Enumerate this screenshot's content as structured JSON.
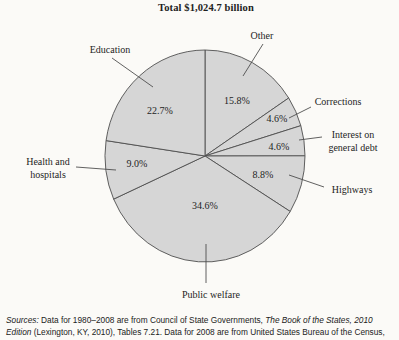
{
  "figure": {
    "title": "Total $1,024.7 billion",
    "source_lines": [
      [
        {
          "text": "Sources:",
          "italic": true
        },
        {
          "text": " Data for 1980–2008 are from Council of State Governments, ",
          "italic": false
        },
        {
          "text": "The Book of the States, 2010",
          "italic": true
        }
      ],
      [
        {
          "text": "Edition",
          "italic": true
        },
        {
          "text": " (Lexington, KY, 2010), Tables 7.21. Data for 2008 are from United States Bureau of the Census,",
          "italic": false
        }
      ]
    ]
  },
  "chart_data": {
    "type": "pie",
    "title": "Total $1,024.7 billion",
    "direction": "clockwise",
    "start_angle_deg": 0,
    "legend": "none",
    "categories": [
      "Other",
      "Corrections",
      "Interest on general debt",
      "Highways",
      "Public welfare",
      "Health and hospitals",
      "Education"
    ],
    "values": [
      15.8,
      4.6,
      4.6,
      8.8,
      34.6,
      9.0,
      22.7
    ],
    "geometry": {
      "cx": 205,
      "cy": 156,
      "rx": 100,
      "ry": 106
    },
    "slices": [
      {
        "label": "Other",
        "value": 15.8,
        "pct_text": "15.8%",
        "pct_pos": [
          237,
          100
        ],
        "name_lines": [
          "Other"
        ],
        "name_pos": [
          262,
          35
        ],
        "leader": [
          263,
          44,
          243,
          76
        ]
      },
      {
        "label": "Corrections",
        "value": 4.6,
        "pct_text": "4.6%",
        "pct_pos": [
          277,
          118
        ],
        "name_lines": [
          "Corrections"
        ],
        "name_pos": [
          338,
          101
        ],
        "leader": [
          311,
          107,
          289,
          118
        ]
      },
      {
        "label": "Interest on general debt",
        "value": 4.6,
        "pct_text": "4.6%",
        "pct_pos": [
          279,
          146
        ],
        "name_lines": [
          "Interest on",
          "general debt"
        ],
        "name_pos": [
          353,
          141
        ],
        "leader": [
          322,
          137,
          299,
          140
        ]
      },
      {
        "label": "Highways",
        "value": 8.8,
        "pct_text": "8.8%",
        "pct_pos": [
          263,
          174
        ],
        "name_lines": [
          "Highways"
        ],
        "name_pos": [
          352,
          189
        ],
        "leader": [
          324,
          187,
          289,
          175
        ]
      },
      {
        "label": "Public welfare",
        "value": 34.6,
        "pct_text": "34.6%",
        "pct_pos": [
          205,
          205
        ],
        "name_lines": [
          "Public welfare"
        ],
        "name_pos": [
          211,
          294
        ],
        "leader": [
          206,
          244,
          206,
          283
        ]
      },
      {
        "label": "Health and hospitals",
        "value": 9.0,
        "pct_text": "9.0%",
        "pct_pos": [
          137,
          163
        ],
        "name_lines": [
          "Health and",
          "hospitals"
        ],
        "name_pos": [
          48,
          168
        ],
        "leader": [
          76,
          167,
          116,
          170
        ]
      },
      {
        "label": "Education",
        "value": 22.7,
        "pct_text": "22.7%",
        "pct_pos": [
          160,
          110
        ],
        "name_lines": [
          "Education"
        ],
        "name_pos": [
          110,
          49
        ],
        "leader": [
          112,
          58,
          153,
          87
        ]
      }
    ]
  },
  "style": {
    "slice_fill": "#d6d6d6",
    "line_color": "#4f4f4f",
    "text_color": "#1e1e1e",
    "background": "#fbfaf7"
  }
}
